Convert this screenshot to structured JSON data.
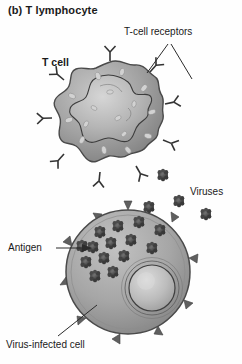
{
  "figure": {
    "title": "(b) T lymphocyte",
    "type": "biology-diagram",
    "background_color": "#ffffff",
    "ink_color": "#1a1a1a"
  },
  "labels": {
    "t_cell": "T cell",
    "t_cell_receptors": "T-cell receptors",
    "viruses": "Viruses",
    "antigen": "Antigen",
    "virus_infected_cell": "Virus-infected cell"
  },
  "structures": {
    "t_cell": {
      "name": "T cell",
      "shape": "lobed-round",
      "center": [
        110,
        117
      ],
      "radius": 56,
      "fill_color": "#9a9a9a",
      "outline_color": "#4a4a4a",
      "nucleus": {
        "name": "t-cell-nucleus",
        "shape": "irregular-lobed",
        "fill_color": "#b4b4b4",
        "outline_color": "#3c3c3c"
      },
      "receptors": {
        "name": "t-cell-receptors",
        "glyph": "Y-shape",
        "count": 9,
        "color": "#3a3a3a"
      },
      "surface_granules": {
        "count": 16,
        "color": "#cfcfcf"
      }
    },
    "infected_cell": {
      "name": "virus-infected cell",
      "shape": "round",
      "center": [
        128,
        272
      ],
      "radius": 62,
      "fill_color": "#a3a3a3",
      "outline_color": "#4a4a4a",
      "nucleus": {
        "name": "infected-cell-nucleus",
        "shape": "round",
        "center": [
          152,
          288
        ],
        "radius": 23,
        "fill_color": "#bdbdbd",
        "outline_color": "#3c3c3c"
      },
      "membrane_spikes": {
        "name": "antigen-spikes",
        "count": 10,
        "color": "#5a5a5a"
      },
      "internal_viruses": {
        "count": 14,
        "color": "#4e4e4e"
      }
    },
    "free_viruses": {
      "name": "free-viruses",
      "count": 4,
      "color": "#4e4e4e",
      "positions": [
        [
          163,
          175
        ],
        [
          178,
          200
        ],
        [
          206,
          214
        ],
        [
          150,
          208
        ]
      ]
    }
  },
  "leaders": [
    {
      "name": "leader-receptors-left",
      "from": [
        168,
        44
      ],
      "to": [
        148,
        73
      ]
    },
    {
      "name": "leader-receptors-right",
      "from": [
        171,
        44
      ],
      "to": [
        192,
        78
      ]
    },
    {
      "name": "leader-antigen",
      "from": [
        56,
        248
      ],
      "to": [
        88,
        248
      ],
      "arrow": true
    },
    {
      "name": "leader-infected-cell",
      "from": [
        58,
        336
      ],
      "to": [
        96,
        306
      ]
    }
  ]
}
